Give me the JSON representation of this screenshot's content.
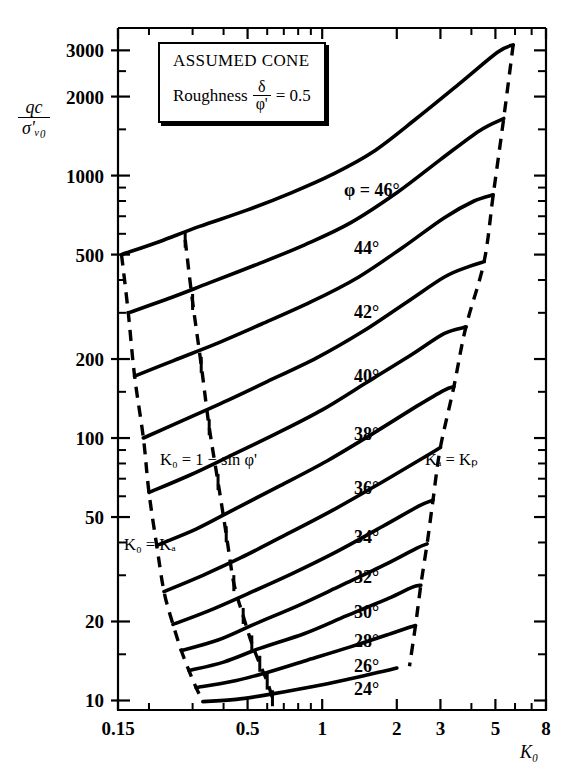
{
  "figure": {
    "kind": "geotechnical-design-chart",
    "legend": {
      "title": "ASSUMED CONE",
      "roughness_label": "Roughness",
      "roughness_numerator": "δ",
      "roughness_denominator": "φ'",
      "roughness_equals": "= 0.5"
    },
    "annotations": {
      "left_upper": "K₀ = 1 − sin φ'",
      "left_lower": "K₀ = Kₐ",
      "right": "Kₐ = Kₚ"
    },
    "axis_titles": {
      "y_numerator": "qc",
      "y_denominator": "σ'ᵥ₀",
      "x": "K₀"
    }
  },
  "chart_data": {
    "type": "line",
    "title": "",
    "subtitle": "",
    "xlabel": "K0",
    "ylabel": "qc / sigma'v0",
    "xscale": "log",
    "yscale": "log",
    "xlim": [
      0.15,
      8
    ],
    "ylim": [
      9.2,
      3650
    ],
    "grid": false,
    "legend_position": "inline-curve-labels",
    "xticks": [
      0.15,
      0.5,
      1,
      2,
      3,
      5,
      8
    ],
    "xtick_labels": [
      "0.15",
      "0.5",
      "1",
      "2",
      "3",
      "5",
      "8"
    ],
    "xminor": [
      0.2,
      0.3,
      0.4,
      0.6,
      0.7,
      0.8,
      0.9,
      4,
      6,
      7
    ],
    "yticks": [
      10,
      20,
      50,
      100,
      200,
      500,
      1000,
      2000,
      3000
    ],
    "ytick_labels": [
      "10",
      "20",
      "50",
      "100",
      "200",
      "500",
      "1000",
      "2000",
      "3000"
    ],
    "yminor": [
      15,
      30,
      40,
      60,
      70,
      80,
      90,
      150,
      300,
      400,
      600,
      700,
      800,
      900,
      1500,
      2500
    ],
    "series": [
      {
        "name": "phi = 46°",
        "label": "φ = 46°",
        "points": [
          [
            0.155,
            500
          ],
          [
            0.22,
            560
          ],
          [
            0.32,
            640
          ],
          [
            0.5,
            740
          ],
          [
            0.75,
            860
          ],
          [
            1.1,
            1010
          ],
          [
            1.6,
            1230
          ],
          [
            2.4,
            1650
          ],
          [
            3.6,
            2250
          ],
          [
            5.1,
            2950
          ],
          [
            5.9,
            3150
          ]
        ]
      },
      {
        "name": "phi = 44°",
        "label": "44°",
        "points": [
          [
            0.165,
            300
          ],
          [
            0.24,
            340
          ],
          [
            0.35,
            390
          ],
          [
            0.55,
            460
          ],
          [
            0.85,
            545
          ],
          [
            1.3,
            660
          ],
          [
            2.0,
            860
          ],
          [
            3.0,
            1150
          ],
          [
            4.3,
            1480
          ],
          [
            5.4,
            1650
          ]
        ]
      },
      {
        "name": "phi = 42°",
        "label": "42°",
        "points": [
          [
            0.175,
            172
          ],
          [
            0.25,
            197
          ],
          [
            0.37,
            228
          ],
          [
            0.57,
            272
          ],
          [
            0.9,
            330
          ],
          [
            1.4,
            410
          ],
          [
            2.1,
            530
          ],
          [
            3.1,
            690
          ],
          [
            4.1,
            800
          ],
          [
            4.9,
            845
          ]
        ]
      },
      {
        "name": "phi = 40°",
        "label": "40°",
        "points": [
          [
            0.19,
            100
          ],
          [
            0.27,
            116
          ],
          [
            0.4,
            137
          ],
          [
            0.6,
            164
          ],
          [
            0.95,
            202
          ],
          [
            1.45,
            254
          ],
          [
            2.2,
            330
          ],
          [
            3.1,
            410
          ],
          [
            3.9,
            450
          ],
          [
            4.5,
            470
          ]
        ]
      },
      {
        "name": "phi = 38°",
        "label": "38°",
        "points": [
          [
            0.2,
            62
          ],
          [
            0.29,
            72
          ],
          [
            0.42,
            85
          ],
          [
            0.64,
            103
          ],
          [
            1.0,
            128
          ],
          [
            1.5,
            162
          ],
          [
            2.3,
            208
          ],
          [
            3.1,
            250
          ],
          [
            3.8,
            265
          ]
        ]
      },
      {
        "name": "phi = 36°",
        "label": "36°",
        "points": [
          [
            0.215,
            39
          ],
          [
            0.31,
            45
          ],
          [
            0.45,
            54
          ],
          [
            0.68,
            66
          ],
          [
            1.05,
            82
          ],
          [
            1.6,
            104
          ],
          [
            2.4,
            132
          ],
          [
            3.1,
            152
          ],
          [
            3.4,
            157
          ]
        ]
      },
      {
        "name": "phi = 34°",
        "label": "34°",
        "points": [
          [
            0.23,
            26
          ],
          [
            0.33,
            30
          ],
          [
            0.47,
            35
          ],
          [
            0.72,
            43
          ],
          [
            1.1,
            53
          ],
          [
            1.7,
            67
          ],
          [
            2.5,
            83
          ],
          [
            3.0,
            92
          ]
        ]
      },
      {
        "name": "phi = 32°",
        "label": "32°",
        "points": [
          [
            0.25,
            19.5
          ],
          [
            0.35,
            22
          ],
          [
            0.5,
            25.5
          ],
          [
            0.76,
            30.5
          ],
          [
            1.15,
            37
          ],
          [
            1.75,
            46
          ],
          [
            2.45,
            55
          ],
          [
            2.8,
            58
          ]
        ]
      },
      {
        "name": "phi = 30°",
        "label": "30°",
        "points": [
          [
            0.27,
            15.5
          ],
          [
            0.38,
            17
          ],
          [
            0.53,
            19.5
          ],
          [
            0.8,
            23
          ],
          [
            1.2,
            27.5
          ],
          [
            1.8,
            33
          ],
          [
            2.4,
            38
          ],
          [
            2.65,
            39.5
          ]
        ]
      },
      {
        "name": "phi = 28°",
        "label": "28°",
        "points": [
          [
            0.29,
            13
          ],
          [
            0.4,
            14
          ],
          [
            0.56,
            15.8
          ],
          [
            0.85,
            18
          ],
          [
            1.25,
            21
          ],
          [
            1.85,
            24.5
          ],
          [
            2.3,
            27
          ],
          [
            2.5,
            27.5
          ]
        ]
      },
      {
        "name": "phi = 26°",
        "label": "26°",
        "points": [
          [
            0.31,
            11.2
          ],
          [
            0.43,
            11.8
          ],
          [
            0.6,
            12.8
          ],
          [
            0.88,
            14.3
          ],
          [
            1.3,
            16
          ],
          [
            1.9,
            18
          ],
          [
            2.25,
            19
          ],
          [
            2.38,
            19.3
          ]
        ]
      },
      {
        "name": "phi = 24°",
        "label": "24°",
        "points": [
          [
            0.33,
            9.9
          ],
          [
            0.45,
            10.1
          ],
          [
            0.63,
            10.6
          ],
          [
            0.92,
            11.3
          ],
          [
            1.3,
            12.1
          ],
          [
            1.75,
            12.9
          ],
          [
            2.0,
            13.3
          ]
        ]
      }
    ],
    "boundaries": [
      {
        "name": "K0 = Ka",
        "style": "dashed",
        "points": [
          [
            0.155,
            500
          ],
          [
            0.165,
            300
          ],
          [
            0.175,
            172
          ],
          [
            0.19,
            100
          ],
          [
            0.2,
            62
          ],
          [
            0.215,
            39
          ],
          [
            0.23,
            26
          ],
          [
            0.25,
            19.5
          ],
          [
            0.27,
            15.5
          ],
          [
            0.29,
            13
          ],
          [
            0.31,
            11.2
          ],
          [
            0.33,
            9.9
          ]
        ]
      },
      {
        "name": "K0 = 1 - sin phi'",
        "style": "dashed",
        "points": [
          [
            0.28,
            570
          ],
          [
            0.3,
            330
          ],
          [
            0.325,
            190
          ],
          [
            0.35,
            110
          ],
          [
            0.38,
            68
          ],
          [
            0.41,
            43
          ],
          [
            0.44,
            28
          ],
          [
            0.48,
            21
          ],
          [
            0.52,
            16.5
          ],
          [
            0.56,
            13.8
          ],
          [
            0.6,
            11.8
          ],
          [
            0.63,
            10.2
          ]
        ]
      },
      {
        "name": "Ka = Kp",
        "style": "dashed",
        "points": [
          [
            5.9,
            3150
          ],
          [
            5.4,
            1650
          ],
          [
            4.9,
            845
          ],
          [
            4.5,
            470
          ],
          [
            3.8,
            265
          ],
          [
            3.4,
            157
          ],
          [
            3.0,
            92
          ],
          [
            2.8,
            58
          ],
          [
            2.65,
            39.5
          ],
          [
            2.5,
            27.5
          ],
          [
            2.38,
            19.3
          ],
          [
            2.25,
            13.5
          ]
        ]
      }
    ],
    "curve_labels": [
      {
        "text": "φ = 46°",
        "x_px": 344,
        "y_px": 196
      },
      {
        "text": "44°",
        "x_px": 354,
        "y_px": 254
      },
      {
        "text": "42°",
        "x_px": 354,
        "y_px": 318
      },
      {
        "text": "40°",
        "x_px": 354,
        "y_px": 382
      },
      {
        "text": "38°",
        "x_px": 354,
        "y_px": 440
      },
      {
        "text": "36°",
        "x_px": 354,
        "y_px": 494
      },
      {
        "text": "34°",
        "x_px": 354,
        "y_px": 543
      },
      {
        "text": "32°",
        "x_px": 354,
        "y_px": 583
      },
      {
        "text": "30°",
        "x_px": 354,
        "y_px": 618
      },
      {
        "text": "28°",
        "x_px": 354,
        "y_px": 647
      },
      {
        "text": "26°",
        "x_px": 354,
        "y_px": 672
      },
      {
        "text": "24°",
        "x_px": 354,
        "y_px": 695
      }
    ]
  }
}
